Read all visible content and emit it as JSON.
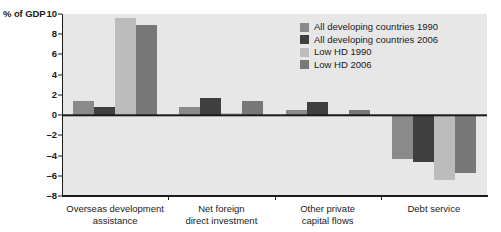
{
  "chart_data": {
    "type": "bar",
    "title": "",
    "subtitle": "",
    "xlabel": "",
    "ylabel": "% of GDP",
    "ylim": [
      -8,
      10
    ],
    "yticks": [
      10,
      8,
      6,
      4,
      2,
      0,
      -2,
      -4,
      -6,
      -8
    ],
    "ytick_labels": [
      "10",
      "8",
      "6",
      "4",
      "2",
      "0",
      "–2",
      "–4",
      "–6",
      "–8"
    ],
    "grid": false,
    "legend_position": "top-right",
    "categories": [
      "Overseas development\nassistance",
      "Net foreign\ndirect investment",
      "Other private\ncapital flows",
      "Debt service"
    ],
    "series": [
      {
        "name": "All developing countries 1990",
        "color": "#8a8a8a",
        "values": [
          1.4,
          0.8,
          0.5,
          -4.3
        ]
      },
      {
        "name": "All developing countries 2006",
        "color": "#3f3f3f",
        "values": [
          0.8,
          1.7,
          1.3,
          -4.6
        ]
      },
      {
        "name": "Low HD 1990",
        "color": "#bcbcbc",
        "values": [
          9.6,
          0.25,
          0.1,
          -6.4
        ]
      },
      {
        "name": "Low HD 2006",
        "color": "#787878",
        "values": [
          8.9,
          1.4,
          0.5,
          -5.7
        ]
      }
    ],
    "plot_background": "#e7e7e7",
    "axis_color": "#1a1a1a"
  }
}
